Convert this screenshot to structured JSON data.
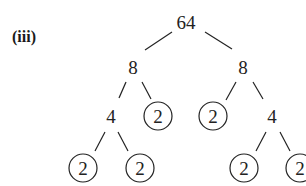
{
  "label": "(iii)",
  "tree": {
    "root": "64",
    "nodes": [
      {
        "id": "n64",
        "value": "64",
        "x": 186,
        "y": 23,
        "circled": false
      },
      {
        "id": "n8L",
        "value": "8",
        "x": 133,
        "y": 68,
        "circled": false
      },
      {
        "id": "n8R",
        "value": "8",
        "x": 243,
        "y": 68,
        "circled": false
      },
      {
        "id": "n4L",
        "value": "4",
        "x": 111,
        "y": 118,
        "circled": false
      },
      {
        "id": "n2a",
        "value": "2",
        "x": 158,
        "y": 118,
        "circled": true
      },
      {
        "id": "n2b",
        "value": "2",
        "x": 213,
        "y": 118,
        "circled": true
      },
      {
        "id": "n4R",
        "value": "4",
        "x": 272,
        "y": 118,
        "circled": false
      },
      {
        "id": "n2c",
        "value": "2",
        "x": 83,
        "y": 170,
        "circled": true
      },
      {
        "id": "n2d",
        "value": "2",
        "x": 140,
        "y": 170,
        "circled": true
      },
      {
        "id": "n2e",
        "value": "2",
        "x": 244,
        "y": 170,
        "circled": true
      },
      {
        "id": "n2f",
        "value": "2",
        "x": 300,
        "y": 170,
        "circled": true
      }
    ],
    "edges": [
      [
        "n64",
        "n8L"
      ],
      [
        "n64",
        "n8R"
      ],
      [
        "n8L",
        "n4L"
      ],
      [
        "n8L",
        "n2a"
      ],
      [
        "n8R",
        "n2b"
      ],
      [
        "n8R",
        "n4R"
      ],
      [
        "n4L",
        "n2c"
      ],
      [
        "n4L",
        "n2d"
      ],
      [
        "n4R",
        "n2e"
      ],
      [
        "n4R",
        "n2f"
      ]
    ]
  },
  "values": {
    "n64": "64",
    "n8L": "8",
    "n8R": "8",
    "n4L": "4",
    "n4R": "4",
    "n2a": "2",
    "n2b": "2",
    "n2c": "2",
    "n2d": "2",
    "n2e": "2",
    "n2f": "2"
  }
}
